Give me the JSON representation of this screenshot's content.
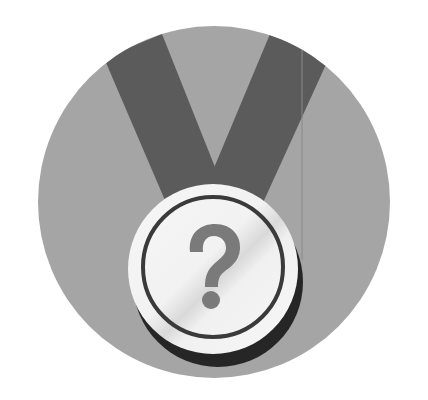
{
  "image": {
    "description": "Medal badge icon with a question mark",
    "width": 428,
    "height": 400,
    "colors": {
      "page_background": "#ffffff",
      "circle_background": "#a5a5a5",
      "ribbon": "#5b5b5b",
      "medal_face": "#f4f4f4",
      "medal_sheen": "#dcdcdc",
      "medal_ring": "#3a3a3a",
      "medal_shadow": "#262626",
      "question_mark": "#7a7a7a"
    },
    "badge": {
      "symbol": "?",
      "icon": "medal-icon"
    }
  }
}
